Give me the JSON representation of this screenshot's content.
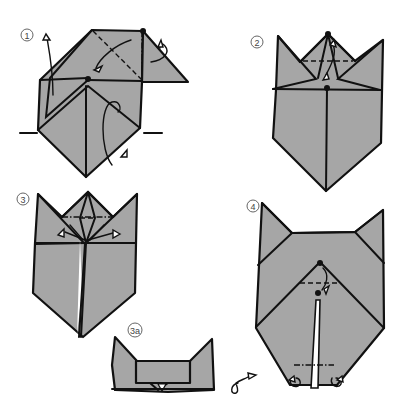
{
  "diagram": {
    "type": "origami-instructions",
    "fill_color": "#a6a6a6",
    "line_color": "#111111",
    "steps": [
      {
        "id": "step-1",
        "label": "1"
      },
      {
        "id": "step-2",
        "label": "2"
      },
      {
        "id": "step-3",
        "label": "3"
      },
      {
        "id": "step-3a",
        "label": "3a"
      },
      {
        "id": "step-4",
        "label": "4"
      }
    ]
  }
}
